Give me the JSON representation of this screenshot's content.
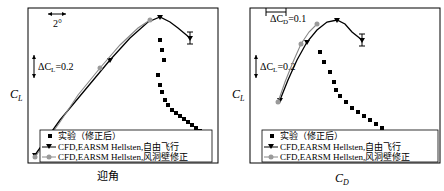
{
  "chart_data": [
    {
      "type": "line",
      "title": "",
      "xlabel": "迎角",
      "ylabel": "C_L",
      "scale_annotations": {
        "x_scale": "2°",
        "y_scale": "ΔC_L=0.2"
      },
      "legend": [
        {
          "label": "实验（修正后）",
          "marker": "square",
          "color": "#000000"
        },
        {
          "label": "CFD,EARSM Hellsten,自由飞行",
          "marker": "triangle-down-line",
          "color": "#000000"
        },
        {
          "label": "CFD,EARSM Hellsten,风洞壁修正",
          "marker": "circle-line",
          "color": "#999999"
        }
      ],
      "series": [
        {
          "name": "CFD,EARSM Hellsten,自由飞行",
          "points_px": [
            [
              35,
              155
            ],
            [
              60,
              120
            ],
            [
              85,
              90
            ],
            [
              110,
              60
            ],
            [
              130,
              38
            ],
            [
              148,
              22
            ],
            [
              160,
              17
            ],
            [
              170,
              22
            ],
            [
              178,
              28
            ],
            [
              190,
              38
            ]
          ]
        },
        {
          "name": "CFD,EARSM Hellsten,风洞壁修正",
          "points_px": [
            [
              35,
              157
            ],
            [
              60,
              122
            ],
            [
              78,
              95
            ],
            [
              100,
              68
            ],
            [
              120,
              45
            ],
            [
              138,
              28
            ],
            [
              150,
              20
            ]
          ]
        },
        {
          "name": "实验（修正后）",
          "points_px": [
            [
              160,
              40
            ],
            [
              162,
              50
            ],
            [
              164,
              60
            ],
            [
              158,
              75
            ],
            [
              160,
              85
            ],
            [
              162,
              92
            ],
            [
              165,
              100
            ],
            [
              168,
              105
            ],
            [
              172,
              110
            ],
            [
              176,
              113
            ],
            [
              180,
              116
            ],
            [
              184,
              119
            ],
            [
              188,
              122
            ],
            [
              192,
              125
            ],
            [
              196,
              128
            ],
            [
              200,
              131
            ],
            [
              204,
              134
            ],
            [
              208,
              137
            ]
          ]
        }
      ],
      "grid": false,
      "legend_position": "lower-left-inside"
    },
    {
      "type": "line",
      "title": "",
      "xlabel": "C_D",
      "ylabel": "C_L",
      "scale_annotations": {
        "x_scale": "ΔC_D=0.1",
        "y_scale": "ΔC_L=0.2"
      },
      "legend": [
        {
          "label": "实验（修正后）",
          "marker": "square",
          "color": "#000000"
        },
        {
          "label": "CFD,EARSM Hellsten,自由飞行",
          "marker": "triangle-down-line",
          "color": "#000000"
        },
        {
          "label": "CFD,EARSM Hellsten,风洞壁修正",
          "marker": "circle-line",
          "color": "#999999"
        }
      ],
      "series": [
        {
          "name": "CFD,EARSM Hellsten,自由飞行",
          "points_px": [
            [
              58,
              100
            ],
            [
              66,
              80
            ],
            [
              75,
              60
            ],
            [
              85,
              42
            ],
            [
              95,
              30
            ],
            [
              105,
              22
            ],
            [
              115,
              20
            ],
            [
              123,
              24
            ],
            [
              130,
              32
            ],
            [
              140,
              40
            ]
          ]
        },
        {
          "name": "CFD,EARSM Hellsten,风洞壁修正",
          "points_px": [
            [
              56,
              102
            ],
            [
              63,
              82
            ],
            [
              71,
              62
            ],
            [
              79,
              44
            ],
            [
              87,
              32
            ],
            [
              95,
              24
            ]
          ]
        },
        {
          "name": "实验（修正后）",
          "points_px": [
            [
              98,
              52
            ],
            [
              102,
              62
            ],
            [
              108,
              72
            ],
            [
              112,
              82
            ],
            [
              114,
              90
            ],
            [
              118,
              96
            ],
            [
              124,
              102
            ],
            [
              130,
              108
            ],
            [
              136,
              112
            ],
            [
              142,
              116
            ],
            [
              148,
              120
            ],
            [
              154,
              124
            ],
            [
              160,
              128
            ],
            [
              166,
              132
            ],
            [
              172,
              136
            ],
            [
              178,
              140
            ],
            [
              184,
              143
            ],
            [
              190,
              146
            ]
          ]
        }
      ],
      "grid": false,
      "legend_position": "lower-left-inside"
    }
  ],
  "left": {
    "xlabel": "迎角",
    "ylabel_main": "C",
    "ylabel_sub": "L",
    "scale_x": "2°",
    "scale_y_prefix": "ΔC",
    "scale_y_sub": "L",
    "scale_y_suffix": "=0.2",
    "legend": [
      "实验（修正后）",
      "CFD,EARSM Hellsten,自由飞行",
      "CFD,EARSM Hellsten,风洞壁修正"
    ]
  },
  "right": {
    "xlabel_main": "C",
    "xlabel_sub": "D",
    "ylabel_main": "C",
    "ylabel_sub": "L",
    "scale_x_prefix": "ΔC",
    "scale_x_sub": "D",
    "scale_x_suffix": "=0.1",
    "scale_y_prefix": "ΔC",
    "scale_y_sub": "L",
    "scale_y_suffix": "=0.2",
    "legend": [
      "实验（修正后）",
      "CFD,EARSM Hellsten,自由飞行",
      "CFD,EARSM Hellsten,风洞壁修正"
    ]
  },
  "colors": {
    "line_black": "#000000",
    "line_gray": "#888888",
    "marker_gray": "#9a9a9a",
    "frame": "#000000"
  }
}
